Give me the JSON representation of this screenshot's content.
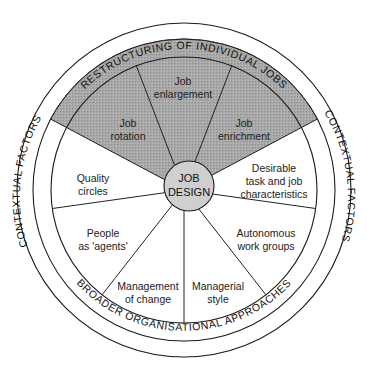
{
  "diagram": {
    "center": {
      "line1": "JOB",
      "line2": "DESIGN"
    },
    "outer_ring": {
      "left_label": "CONTEXTUAL FACTORS",
      "right_label": "CONTEXTUAL FACTORS"
    },
    "middle_ring": {
      "top_label": "RESTRUCTURING OF INDIVIDUAL JOBS",
      "bottom_label": "BROADER ORGANISATIONAL APPROACHES"
    },
    "segments": [
      {
        "id": "job-rotation",
        "group": "restructuring",
        "lines": [
          "Job",
          "rotation"
        ]
      },
      {
        "id": "job-enlargement",
        "group": "restructuring",
        "lines": [
          "Job",
          "enlargement"
        ]
      },
      {
        "id": "job-enrichment",
        "group": "restructuring",
        "lines": [
          "Job",
          "enrichment"
        ]
      },
      {
        "id": "desirable-task",
        "group": "broader",
        "lines": [
          "Desirable",
          "task and job",
          "characteristics"
        ]
      },
      {
        "id": "autonomous-work-groups",
        "group": "broader",
        "lines": [
          "Autonomous",
          "work groups"
        ]
      },
      {
        "id": "managerial-style",
        "group": "broader",
        "lines": [
          "Managerial",
          "style"
        ]
      },
      {
        "id": "management-of-change",
        "group": "broader",
        "lines": [
          "Management",
          "of change"
        ]
      },
      {
        "id": "people-as-agents",
        "group": "broader",
        "lines": [
          "People",
          "as 'agents'"
        ]
      },
      {
        "id": "quality-circles",
        "group": "broader",
        "lines": [
          "Quality",
          "circles"
        ]
      }
    ],
    "colors": {
      "outer_ring": "#f4f4f4",
      "band_light": "#e0e0e0",
      "segment_light": "#e2e2e2",
      "dark_sector": "#a4a4a4",
      "center_circle": "#cfcfcf",
      "stroke": "#1a1a1a"
    }
  }
}
